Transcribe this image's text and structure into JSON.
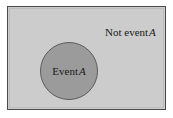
{
  "diagram": {
    "type": "venn-diagram",
    "sample_space": {
      "name": "sample-space-rectangle",
      "fill_color": "#cccccc",
      "border_color": "#4a4a4a"
    },
    "regions": [
      {
        "id": "event-a",
        "shape": "circle",
        "label_text": "Event",
        "label_variable": "A",
        "full_label": "Event A",
        "fill_color": "#9b9b9b",
        "border_color": "#5c5c5c"
      },
      {
        "id": "not-event-a",
        "shape": "rectangle-minus-circle",
        "label_text": "Not event",
        "label_variable": "A",
        "full_label": "Not event A",
        "fill_color": "#cccccc"
      }
    ]
  }
}
